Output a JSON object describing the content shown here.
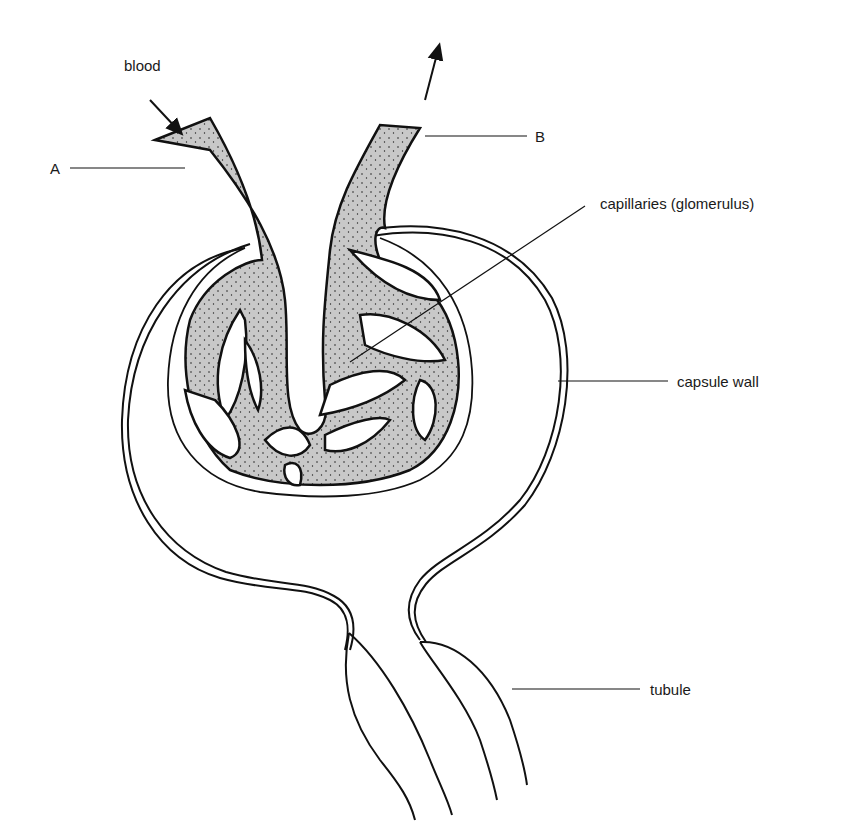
{
  "diagram": {
    "type": "biology",
    "labels": {
      "blood": "blood",
      "a": "A",
      "b": "B",
      "capillaries": "capillaries (glomerulus)",
      "capsule_wall": "capsule wall",
      "tubule": "tubule"
    },
    "colors": {
      "vessel_fill": "#c8c8c8",
      "stroke": "#111111",
      "background": "#ffffff"
    }
  }
}
